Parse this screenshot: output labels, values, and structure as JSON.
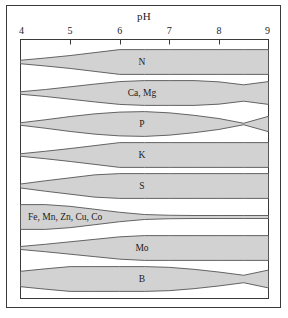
{
  "chart_data": {
    "type": "area",
    "title": "pH",
    "xlabel": "pH",
    "ylabel": "",
    "xlim": [
      4,
      9
    ],
    "xticks": [
      4,
      5,
      6,
      7,
      8,
      9
    ],
    "xtick_labels": [
      "4",
      "5",
      "6",
      "7",
      "8",
      "9"
    ],
    "grid": false,
    "legend": "none",
    "fill_color": "#d2d2d2",
    "line_color": "#555555",
    "frame_color": "#3a3a36",
    "series": [
      {
        "name": "N",
        "label": "N",
        "x": [
          4.0,
          4.5,
          5.0,
          5.5,
          6.0,
          6.5,
          7.0,
          7.5,
          8.0,
          8.5,
          9.0
        ],
        "values": [
          0.14,
          0.32,
          0.52,
          0.76,
          1.0,
          1.0,
          1.0,
          1.0,
          1.0,
          1.0,
          1.0
        ]
      },
      {
        "name": "Ca, Mg",
        "label": "Ca, Mg",
        "x": [
          4.0,
          4.5,
          5.0,
          5.5,
          6.0,
          6.5,
          7.0,
          7.5,
          8.0,
          8.5,
          9.0
        ],
        "values": [
          0.1,
          0.28,
          0.5,
          0.72,
          0.92,
          1.0,
          1.0,
          1.0,
          0.9,
          0.66,
          0.92
        ]
      },
      {
        "name": "P",
        "label": "P",
        "x": [
          4.0,
          4.5,
          5.0,
          5.5,
          6.0,
          6.5,
          7.0,
          7.5,
          8.0,
          8.5,
          9.0
        ],
        "values": [
          0.1,
          0.34,
          0.6,
          0.82,
          0.96,
          1.0,
          0.9,
          0.7,
          0.44,
          0.06,
          0.62
        ]
      },
      {
        "name": "K",
        "label": "K",
        "x": [
          4.0,
          4.5,
          5.0,
          5.5,
          6.0,
          6.5,
          7.0,
          7.5,
          8.0,
          8.5,
          9.0
        ],
        "values": [
          0.1,
          0.3,
          0.52,
          0.76,
          1.0,
          1.0,
          1.0,
          1.0,
          1.0,
          1.0,
          1.0
        ]
      },
      {
        "name": "S",
        "label": "S",
        "x": [
          4.0,
          4.5,
          5.0,
          5.5,
          6.0,
          6.5,
          7.0,
          7.5,
          8.0,
          8.5,
          9.0
        ],
        "values": [
          0.16,
          0.42,
          0.66,
          0.9,
          1.0,
          1.0,
          1.0,
          1.0,
          1.0,
          1.0,
          1.0
        ]
      },
      {
        "name": "Fe, Mn, Zn, Cu, Co",
        "label": "Fe, Mn, Zn, Cu, Co",
        "x": [
          4.0,
          4.5,
          5.0,
          5.5,
          6.0,
          6.5,
          7.0,
          7.5,
          8.0,
          8.5,
          9.0
        ],
        "values": [
          1.0,
          1.0,
          0.86,
          0.62,
          0.38,
          0.2,
          0.14,
          0.12,
          0.12,
          0.12,
          0.12
        ]
      },
      {
        "name": "Mo",
        "label": "Mo",
        "x": [
          4.0,
          4.5,
          5.0,
          5.5,
          6.0,
          6.5,
          7.0,
          7.5,
          8.0,
          8.5,
          9.0
        ],
        "values": [
          0.12,
          0.3,
          0.5,
          0.7,
          0.9,
          1.0,
          1.0,
          1.0,
          1.0,
          1.0,
          1.0
        ]
      },
      {
        "name": "B",
        "label": "B",
        "x": [
          4.0,
          4.5,
          5.0,
          5.5,
          6.0,
          6.5,
          7.0,
          7.5,
          8.0,
          8.5,
          9.0
        ],
        "values": [
          0.62,
          0.82,
          1.0,
          1.0,
          1.0,
          1.0,
          0.94,
          0.78,
          0.56,
          0.3,
          0.72
        ]
      }
    ]
  }
}
